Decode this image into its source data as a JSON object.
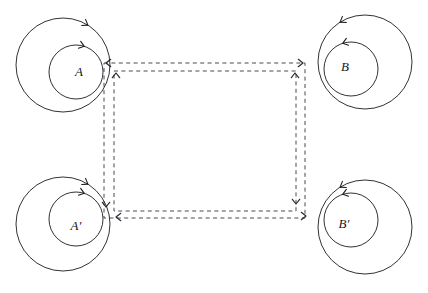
{
  "figure": {
    "kind": "commutative-diagram",
    "background_color": "#ffffff",
    "curve_color": "#1b1b20",
    "dashed_color": "#4a4a52",
    "label_color": "#15151a",
    "canvas": {
      "width": 428,
      "height": 293
    }
  },
  "nodes": [
    {
      "id": "A",
      "label": "A",
      "position": "top-left",
      "orientation": "clockwise",
      "label_x": 79,
      "label_y": 76,
      "outer": {
        "cx": 63,
        "cy": 65,
        "r": 47
      },
      "inner": {
        "cx": 76,
        "cy": 72,
        "r": 27
      },
      "outer_arrow_angle": -58,
      "inner_arrow_angle": -72
    },
    {
      "id": "B",
      "label": "B",
      "position": "top-right",
      "orientation": "counterclockwise",
      "label_x": 345,
      "label_y": 71,
      "outer": {
        "cx": 365,
        "cy": 62,
        "r": 47
      },
      "inner": {
        "cx": 351,
        "cy": 69,
        "r": 27
      },
      "outer_arrow_angle": -122,
      "inner_arrow_angle": -108
    },
    {
      "id": "Aprime",
      "label": "A′",
      "position": "bottom-left",
      "orientation": "clockwise",
      "label_x": 76,
      "label_y": 230,
      "outer": {
        "cx": 63,
        "cy": 224,
        "r": 47
      },
      "inner": {
        "cx": 76,
        "cy": 219,
        "r": 27
      },
      "outer_arrow_angle": -58,
      "inner_arrow_angle": -72
    },
    {
      "id": "Bprime",
      "label": "B′",
      "position": "bottom-right",
      "orientation": "counterclockwise",
      "label_x": 344,
      "label_y": 228,
      "outer": {
        "cx": 365,
        "cy": 227,
        "r": 47
      },
      "inner": {
        "cx": 351,
        "cy": 220,
        "r": 27
      },
      "outer_arrow_angle": -122,
      "inner_arrow_angle": -108
    }
  ],
  "dashed_circuits": [
    {
      "id": "outer-circuit",
      "left": 104,
      "top": 63,
      "right": 305,
      "bottom": 218,
      "style": "dashed"
    },
    {
      "id": "inner-circuit",
      "left": 114,
      "top": 71,
      "right": 296,
      "bottom": 211,
      "style": "dashed"
    }
  ],
  "dashed_arrowheads": [
    {
      "id": "top-left-west",
      "x": 106,
      "y": 63,
      "direction": "west"
    },
    {
      "id": "top-left-north",
      "x": 116,
      "y": 73,
      "direction": "north"
    },
    {
      "id": "top-right-east",
      "x": 303,
      "y": 63,
      "direction": "east"
    },
    {
      "id": "top-right-north",
      "x": 295,
      "y": 73,
      "direction": "north"
    },
    {
      "id": "bottom-left-south",
      "x": 106,
      "y": 207,
      "direction": "south"
    },
    {
      "id": "bottom-left-west",
      "x": 116,
      "y": 217,
      "direction": "west"
    },
    {
      "id": "bottom-right-south",
      "x": 296,
      "y": 204,
      "direction": "south"
    },
    {
      "id": "bottom-right-east",
      "x": 306,
      "y": 216,
      "direction": "east"
    }
  ]
}
